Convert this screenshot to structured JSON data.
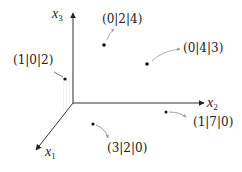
{
  "diagram": {
    "title": "",
    "axes": [
      {
        "id": "x1",
        "name": "x",
        "sub": "1",
        "label_pos": [
          45,
          145
        ]
      },
      {
        "id": "x2",
        "name": "x",
        "sub": "2",
        "label_pos": [
          207,
          96
        ]
      },
      {
        "id": "x3",
        "name": "x",
        "sub": "3",
        "label_pos": [
          52,
          7
        ]
      }
    ],
    "points": [
      {
        "label": "(0|2|4)",
        "coords": [
          0,
          2,
          4
        ],
        "dot": [
          104,
          45
        ],
        "label_pos": [
          102,
          13
        ]
      },
      {
        "label": "(0|4|3)",
        "coords": [
          0,
          4,
          3
        ],
        "dot": [
          147,
          64
        ],
        "label_pos": [
          183,
          42
        ]
      },
      {
        "label": "(1|0|2)",
        "coords": [
          1,
          0,
          2
        ],
        "dot": [
          65,
          79
        ],
        "label_pos": [
          13,
          54
        ]
      },
      {
        "label": "(3|2|0)",
        "coords": [
          3,
          2,
          0
        ],
        "dot": [
          93,
          124
        ],
        "label_pos": [
          107,
          142
        ]
      },
      {
        "label": "(1|7|0)",
        "coords": [
          1,
          7,
          0
        ],
        "dot": [
          166,
          112
        ],
        "label_pos": [
          193,
          116
        ]
      }
    ],
    "colors": {
      "axis": "#333333",
      "dot": "#111111",
      "leader": "#888888",
      "text": "#222222"
    }
  }
}
